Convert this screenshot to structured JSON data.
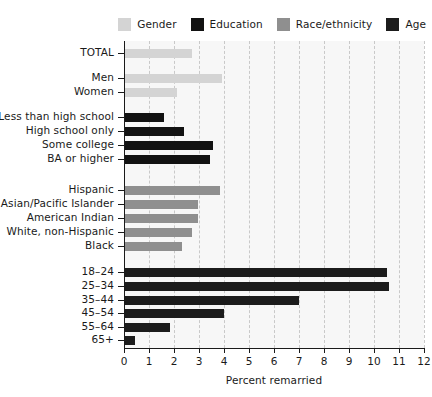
{
  "chart_data": {
    "type": "bar",
    "orientation": "horizontal",
    "title": "",
    "xlabel": "Percent remarried",
    "ylabel": "",
    "xlim": [
      0,
      12
    ],
    "xticks": [
      0,
      1,
      2,
      3,
      4,
      5,
      6,
      7,
      8,
      9,
      10,
      11,
      12
    ],
    "xticklabels": [
      "0",
      "1",
      "2",
      "3",
      "4",
      "5",
      "6",
      "7",
      "8",
      "9",
      "10",
      "11",
      "12"
    ],
    "grid": "vertical-dashed",
    "legend_position": "top-right",
    "legend": [
      {
        "label": "Gender",
        "color": "#d4d4d4"
      },
      {
        "label": "Education",
        "color": "#121212"
      },
      {
        "label": "Race/ethnicity",
        "color": "#8f8f8f"
      },
      {
        "label": "Age",
        "color": "#1c1c1c"
      }
    ],
    "groups": [
      {
        "name": "Total",
        "series": "Gender",
        "color": "#d4d4d4",
        "categories": [
          "TOTAL"
        ],
        "values": [
          2.7
        ]
      },
      {
        "name": "Gender",
        "series": "Gender",
        "color": "#d4d4d4",
        "categories": [
          "Men",
          "Women"
        ],
        "values": [
          3.9,
          2.1
        ]
      },
      {
        "name": "Education",
        "series": "Education",
        "color": "#121212",
        "categories": [
          "Less than high school",
          "High school only",
          "Some college",
          "BA or higher"
        ],
        "values": [
          1.6,
          2.4,
          3.55,
          3.45
        ]
      },
      {
        "name": "Race/ethnicity",
        "series": "Race/ethnicity",
        "color": "#8f8f8f",
        "categories": [
          "Hispanic",
          "Asian/Pacific Islander",
          "American Indian",
          "White, non-Hispanic",
          "Black"
        ],
        "values": [
          3.85,
          2.95,
          2.95,
          2.7,
          2.3
        ]
      },
      {
        "name": "Age",
        "series": "Age",
        "color": "#1c1c1c",
        "categories": [
          "18–24",
          "25–34",
          "35–44",
          "45–54",
          "55–64",
          "65+"
        ],
        "values": [
          10.5,
          10.6,
          7.0,
          4.0,
          1.85,
          0.45
        ]
      }
    ],
    "all_categories": [
      "TOTAL",
      "Men",
      "Women",
      "Less than high school",
      "High school only",
      "Some college",
      "BA or higher",
      "Hispanic",
      "Asian/Pacific Islander",
      "American Indian",
      "White, non-Hispanic",
      "Black",
      "18–24",
      "25–34",
      "35–44",
      "45–54",
      "55–64",
      "65+"
    ],
    "all_values": [
      2.7,
      3.9,
      2.1,
      1.6,
      2.4,
      3.55,
      3.45,
      3.85,
      2.95,
      2.95,
      2.7,
      2.3,
      10.5,
      10.6,
      7.0,
      4.0,
      1.85,
      0.45
    ],
    "all_colors": [
      "#d4d4d4",
      "#d4d4d4",
      "#d4d4d4",
      "#121212",
      "#121212",
      "#121212",
      "#121212",
      "#8f8f8f",
      "#8f8f8f",
      "#8f8f8f",
      "#8f8f8f",
      "#8f8f8f",
      "#1c1c1c",
      "#1c1c1c",
      "#1c1c1c",
      "#1c1c1c",
      "#1c1c1c",
      "#1c1c1c"
    ],
    "plot_background": "#f7f7f7",
    "gridline_color": "#c9c9c9",
    "axis_color": "#1a1a1a"
  }
}
